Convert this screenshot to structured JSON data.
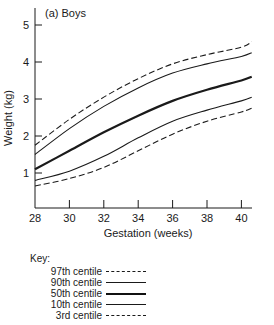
{
  "chart_data": {
    "type": "line",
    "title": "(a) Boys",
    "xlabel": "Gestation (weeks)",
    "ylabel": "Weight (kg)",
    "xlim": [
      28,
      40.8
    ],
    "ylim": [
      0,
      5.3
    ],
    "x_ticks": [
      28,
      30,
      32,
      34,
      36,
      38,
      40
    ],
    "y_ticks": [
      1,
      2,
      3,
      4,
      5
    ],
    "grid": false,
    "legend_position": "below",
    "x": [
      28,
      30,
      32,
      34,
      36,
      38,
      40,
      40.6
    ],
    "series": [
      {
        "name": "97th centile",
        "style": "dashed",
        "values": [
          1.75,
          2.45,
          3.05,
          3.55,
          3.95,
          4.2,
          4.4,
          4.55
        ]
      },
      {
        "name": "90th centile",
        "style": "solid",
        "values": [
          1.5,
          2.2,
          2.8,
          3.3,
          3.7,
          3.95,
          4.15,
          4.25
        ]
      },
      {
        "name": "50th centile",
        "style": "bold",
        "values": [
          1.1,
          1.6,
          2.1,
          2.55,
          2.95,
          3.25,
          3.5,
          3.6
        ]
      },
      {
        "name": "10th centile",
        "style": "solid",
        "values": [
          0.8,
          1.05,
          1.45,
          1.95,
          2.4,
          2.7,
          2.95,
          3.05
        ]
      },
      {
        "name": "3rd centile",
        "style": "dashed",
        "values": [
          0.65,
          0.85,
          1.15,
          1.6,
          2.05,
          2.4,
          2.65,
          2.75
        ]
      }
    ]
  },
  "key": {
    "title": "Key:",
    "items": [
      {
        "label": "97th centile",
        "style": "dashed"
      },
      {
        "label": "90th centile",
        "style": "solid"
      },
      {
        "label": "50th centile",
        "style": "bold"
      },
      {
        "label": "10th centile",
        "style": "solid"
      },
      {
        "label": "3rd centile",
        "style": "dashed"
      }
    ]
  }
}
